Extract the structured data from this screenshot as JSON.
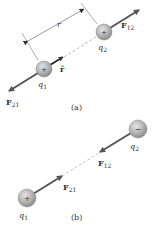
{
  "figure": {
    "part_a": {
      "caption": "(a)",
      "charge1": {
        "label": "q",
        "sub": "1",
        "sign": "+"
      },
      "charge2": {
        "label": "q",
        "sub": "2",
        "sign": "+"
      },
      "distance_label": "r",
      "unit_vector_label": "r̂",
      "force12": {
        "label": "F",
        "sub": "12"
      },
      "force21": {
        "label": "F",
        "sub": "21"
      }
    },
    "part_b": {
      "caption": "(b)",
      "charge1": {
        "label": "q",
        "sub": "1",
        "sign": "+"
      },
      "charge2": {
        "label": "q",
        "sub": "2",
        "sign": "−"
      },
      "force12": {
        "label": "F",
        "sub": "12"
      },
      "force21": {
        "label": "F",
        "sub": "21"
      }
    }
  },
  "colors": {
    "arrow": "#555555",
    "charge_fill": "#b5b5b5",
    "charge_edge": "#8a8a8a",
    "text": "#333333"
  }
}
